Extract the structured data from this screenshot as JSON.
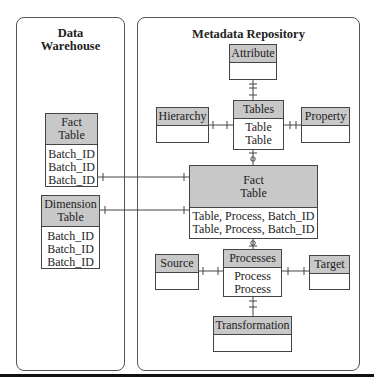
{
  "panels": {
    "data_warehouse": {
      "title_line1": "Data",
      "title_line2": "Warehouse"
    },
    "metadata_repository": {
      "title": "Metadata Repository"
    }
  },
  "entities": {
    "dw_fact_table": {
      "header_line1": "Fact",
      "header_line2": "Table",
      "rows": [
        "Batch_ID",
        "Batch_ID",
        "Batch_ID"
      ]
    },
    "dw_dimension_table": {
      "header_line1": "Dimension",
      "header_line2": "Table",
      "rows": [
        "Batch_ID",
        "Batch_ID",
        "Batch_ID"
      ]
    },
    "attribute": {
      "header": "Attribute",
      "rows": []
    },
    "tables": {
      "header": "Tables",
      "rows": [
        "Table",
        "Table"
      ]
    },
    "hierarchy": {
      "header": "Hierarchy",
      "rows": []
    },
    "property": {
      "header": "Property",
      "rows": []
    },
    "md_fact_table": {
      "header_line1": "Fact",
      "header_line2": "Table",
      "rows": [
        "Table, Process, Batch_ID",
        "Table, Process, Batch_ID"
      ]
    },
    "processes": {
      "header": "Processes",
      "rows": [
        "Process",
        "Process"
      ]
    },
    "source": {
      "header": "Source",
      "rows": []
    },
    "target": {
      "header": "Target",
      "rows": []
    },
    "transformation": {
      "header": "Transformation",
      "rows": []
    }
  },
  "relationships": [
    {
      "from": "Attribute",
      "to": "Tables",
      "type": "many-to-one"
    },
    {
      "from": "Hierarchy",
      "to": "Tables",
      "type": "many-to-one"
    },
    {
      "from": "Property",
      "to": "Tables",
      "type": "many-to-one"
    },
    {
      "from": "Fact Table",
      "to": "Tables",
      "type": "zero-or-many-to-one"
    },
    {
      "from": "Fact Table",
      "to": "Processes",
      "type": "zero-or-many-to-one"
    },
    {
      "from": "Source",
      "to": "Processes",
      "type": "many-to-one"
    },
    {
      "from": "Target",
      "to": "Processes",
      "type": "many-to-one"
    },
    {
      "from": "Transformation",
      "to": "Processes",
      "type": "many-to-one"
    },
    {
      "from": "DW Fact Table",
      "to": "Fact Table",
      "type": "many-to-one"
    },
    {
      "from": "DW Dimension Table",
      "to": "Fact Table",
      "type": "many-to-one"
    }
  ],
  "colors": {
    "header_fill": "#c8c8c8",
    "border": "#444444",
    "background": "#ffffff"
  }
}
